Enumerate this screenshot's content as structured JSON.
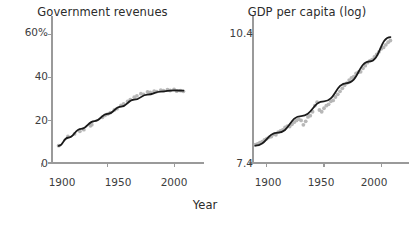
{
  "figure": {
    "shared_xlabel": "Year",
    "background_color": "#ffffff",
    "marker_color": "#b3b3b3",
    "line_color": "#1a1a1a",
    "axis_color": "#9a9a9a"
  },
  "panels": {
    "left": {
      "title": "Government revenues",
      "ytick_labels": [
        "60%",
        "40",
        "20",
        "0"
      ],
      "xtick_labels": [
        "1900",
        "1950",
        "2000"
      ]
    },
    "right": {
      "title": "GDP per capita (log)",
      "ytick_labels": [
        "10.4",
        "7.4"
      ],
      "xtick_labels": [
        "1900",
        "1950",
        "2000"
      ]
    }
  },
  "chart_data": [
    {
      "type": "scatter",
      "panel": "left",
      "title": "Government revenues",
      "xlabel": "Year",
      "ylabel": "",
      "xlim": [
        1908,
        2012
      ],
      "ylim": [
        0,
        65
      ],
      "xticks": [
        1900,
        1950,
        2000
      ],
      "yticks": [
        0,
        20,
        40,
        60
      ],
      "ytick_labels": [
        "0",
        "20",
        "40",
        "60%"
      ],
      "grid": false,
      "legend": "none",
      "units": "percent of GDP",
      "series": [
        {
          "name": "Government revenues (observed)",
          "marker": "circle",
          "color": "#b3b3b3",
          "x": [
            1913,
            1920,
            1925,
            1929,
            1932,
            1937,
            1938,
            1946,
            1948,
            1950,
            1952,
            1955,
            1957,
            1960,
            1962,
            1965,
            1967,
            1970,
            1972,
            1975,
            1977,
            1980,
            1982,
            1985,
            1987,
            1990,
            1992,
            1995,
            1997,
            2000,
            2002,
            2005,
            2007
          ],
          "y": [
            8.1,
            12.4,
            13.6,
            14.8,
            15.6,
            17.4,
            17.9,
            21.4,
            22.3,
            22.9,
            23.6,
            24.8,
            25.4,
            26.9,
            27.6,
            28.8,
            29.6,
            30.8,
            31.4,
            32.4,
            32.1,
            33.2,
            33.0,
            33.6,
            33.4,
            34.1,
            33.8,
            34.3,
            33.9,
            34.4,
            33.6,
            33.8,
            33.5
          ]
        },
        {
          "name": "Fitted trend",
          "type": "line",
          "color": "#1a1a1a",
          "x": [
            1913,
            1920,
            1930,
            1940,
            1950,
            1960,
            1970,
            1980,
            1990,
            2000,
            2007
          ],
          "y": [
            8.0,
            11.8,
            16.0,
            19.6,
            23.0,
            26.4,
            29.6,
            32.0,
            33.4,
            34.0,
            33.8
          ]
        }
      ]
    },
    {
      "type": "scatter",
      "panel": "right",
      "title": "GDP per capita (log)",
      "xlabel": "Year",
      "ylabel": "",
      "xlim": [
        1888,
        2012
      ],
      "ylim": [
        7.4,
        10.6
      ],
      "xticks": [
        1900,
        1950,
        2000
      ],
      "yticks": [
        7.4,
        10.4
      ],
      "ytick_labels": [
        "7.4",
        "10.4"
      ],
      "grid": false,
      "legend": "none",
      "units": "log GDP per capita",
      "series": [
        {
          "name": "GDP per capita (observed, log)",
          "marker": "circle",
          "color": "#b3b3b3",
          "x": [
            1890,
            1892,
            1894,
            1896,
            1898,
            1900,
            1902,
            1904,
            1906,
            1908,
            1910,
            1912,
            1914,
            1916,
            1918,
            1920,
            1922,
            1924,
            1926,
            1928,
            1930,
            1932,
            1934,
            1936,
            1938,
            1940,
            1942,
            1944,
            1946,
            1948,
            1950,
            1952,
            1954,
            1956,
            1958,
            1960,
            1962,
            1964,
            1966,
            1968,
            1970,
            1972,
            1974,
            1976,
            1978,
            1980,
            1982,
            1984,
            1986,
            1988,
            1990,
            1992,
            1994,
            1996,
            1998,
            2000,
            2002,
            2004,
            2006,
            2008
          ],
          "y": [
            7.82,
            7.84,
            7.87,
            7.89,
            7.93,
            7.96,
            7.99,
            8.01,
            8.06,
            8.05,
            8.11,
            8.14,
            8.16,
            8.22,
            8.25,
            8.24,
            8.29,
            8.34,
            8.38,
            8.41,
            8.38,
            8.28,
            8.36,
            8.46,
            8.49,
            8.58,
            8.72,
            8.8,
            8.62,
            8.58,
            8.66,
            8.72,
            8.75,
            8.82,
            8.84,
            8.92,
            8.98,
            9.05,
            9.12,
            9.19,
            9.24,
            9.31,
            9.36,
            9.39,
            9.46,
            9.49,
            9.5,
            9.58,
            9.64,
            9.71,
            9.75,
            9.78,
            9.84,
            9.9,
            9.96,
            10.03,
            10.06,
            10.12,
            10.18,
            10.22
          ]
        },
        {
          "name": "Fitted trend",
          "type": "line",
          "color": "#1a1a1a",
          "x": [
            1890,
            1910,
            1930,
            1950,
            1970,
            1990,
            2008
          ],
          "y": [
            7.8,
            8.1,
            8.48,
            8.82,
            9.24,
            9.74,
            10.3
          ]
        }
      ]
    }
  ]
}
